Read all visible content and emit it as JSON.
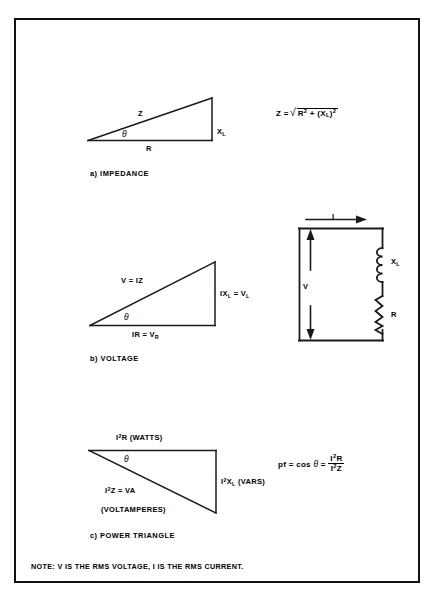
{
  "figure": {
    "note": "NOTE:  V IS THE RMS VOLTAGE, I IS THE RMS CURRENT."
  },
  "impedance": {
    "caption": "a) IMPEDANCE",
    "hypotenuse_label": "Z",
    "vertical_label_base": "X",
    "vertical_label_sub": "L",
    "base_label": "R",
    "angle_label": "θ",
    "formula": {
      "lhs": "Z =",
      "radicand_r": "R",
      "radicand_r_exp": "2",
      "plus": "+",
      "paren_open": "(X",
      "paren_sub": "L",
      "paren_close": ")",
      "paren_exp": "2"
    }
  },
  "voltage": {
    "caption": "b) VOLTAGE",
    "hypotenuse_label": "V = IZ",
    "vertical_label_pre": "IX",
    "vertical_label_sub": "L",
    "vertical_label_post": " = V",
    "vertical_label_sub2": "L",
    "base_label_pre": "IR = V",
    "base_label_sub": "R",
    "angle_label": "θ"
  },
  "circuit": {
    "current_label": "I",
    "voltage_label": "V",
    "inductor_label_base": "X",
    "inductor_label_sub": "L",
    "resistor_label": "R"
  },
  "power": {
    "caption": "c) POWER TRIANGLE",
    "top_label_pre": "I",
    "top_label_exp": "2",
    "top_label_post": "R (WATTS)",
    "vertical_label_pre": "I",
    "vertical_label_exp": "2",
    "vertical_label_mid": "X",
    "vertical_label_sub": "L",
    "vertical_label_post": " (VARS)",
    "hyp_label_pre": "I",
    "hyp_label_exp": "2",
    "hyp_label_post": "Z = VA",
    "hyp_label_line2": "(VOLTAMPERES)",
    "angle_label": "θ",
    "formula": {
      "lhs": "pf = cos",
      "theta": "θ",
      "eq": "=",
      "num_pre": "I",
      "num_exp": "2",
      "num_post": "R",
      "den_pre": "I",
      "den_exp": "2",
      "den_post": "Z"
    }
  },
  "colors": {
    "ink": "#111111",
    "line": "#1a1a1a"
  }
}
